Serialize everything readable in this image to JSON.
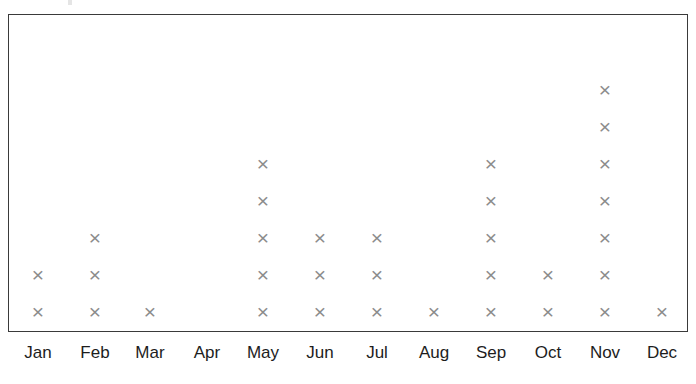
{
  "chart_data": {
    "type": "scatter",
    "title": "",
    "subtitle": "",
    "xlabel": "",
    "ylabel": "",
    "legend": [],
    "grid": false,
    "annotations": [],
    "marker": "x",
    "marker_color": "#8c8c8c",
    "frame_color": "#3a3a3a",
    "background_color": "#ffffff",
    "label_color": "#1d1d1d",
    "axis_visible": {
      "x_tick_labels": true,
      "y_tick_labels": false,
      "frame": true
    },
    "ylim": [
      0,
      8
    ],
    "categories": [
      "Jan",
      "Feb",
      "Mar",
      "Apr",
      "May",
      "Jun",
      "Jul",
      "Aug",
      "Sep",
      "Oct",
      "Nov",
      "Dec"
    ],
    "values": [
      2,
      3,
      1,
      0,
      5,
      3,
      3,
      1,
      5,
      7,
      2,
      1
    ],
    "counts_by_month": [
      {
        "label": "Jan",
        "count": 2
      },
      {
        "label": "Feb",
        "count": 3
      },
      {
        "label": "Mar",
        "count": 1
      },
      {
        "label": "Apr",
        "count": 0
      },
      {
        "label": "May",
        "count": 5
      },
      {
        "label": "Jun",
        "count": 3
      },
      {
        "label": "Jul",
        "count": 3
      },
      {
        "label": "Aug",
        "count": 1
      },
      {
        "label": "Sep",
        "count": 5
      },
      {
        "label": "Oct",
        "count": 2
      },
      {
        "label": "Nov",
        "count": 7
      },
      {
        "label": "Dec",
        "count": 1
      }
    ],
    "marker_glyph": "×",
    "layout": {
      "column_x": [
        38,
        95,
        150,
        207,
        263,
        320,
        377,
        434,
        491,
        548,
        605,
        662
      ],
      "baseline_y": 312,
      "row_step": 37,
      "plot_left": 8,
      "plot_top": 14,
      "plot_width": 680,
      "plot_height": 318
    }
  }
}
